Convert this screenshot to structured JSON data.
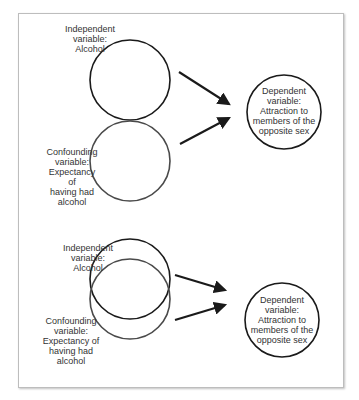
{
  "colors": {
    "stroke": "#1a1a1a",
    "confounding_stroke": "#4a4a4a",
    "frame": "#bdbdbd",
    "text": "#333333"
  },
  "top_panel": {
    "independent": {
      "lines": [
        "Independent",
        "variable:",
        "Alcohol"
      ]
    },
    "confounding": {
      "lines": [
        "Confounding",
        "variable:",
        "Expectancy of",
        "having had",
        "alcohol"
      ]
    },
    "dependent": {
      "lines": [
        "Dependent",
        "variable:",
        "Attraction to",
        "members of the",
        "opposite sex"
      ]
    }
  },
  "bottom_panel": {
    "independent": {
      "lines": [
        "Independent",
        "variable:",
        "Alcohol"
      ]
    },
    "confounding": {
      "lines": [
        "Confounding",
        "variable:",
        "Expectancy of",
        "having had",
        "alcohol"
      ]
    },
    "dependent": {
      "lines": [
        "Dependent",
        "variable:",
        "Attraction to",
        "members of the",
        "opposite sex"
      ]
    }
  }
}
